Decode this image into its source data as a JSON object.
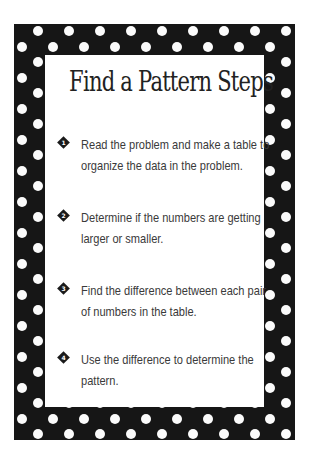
{
  "page": {
    "title": "Find a Pattern Steps",
    "steps": [
      {
        "number": "1",
        "icon": "diamond-number-icon",
        "text": "Read the problem and make a table to organize the data in the problem."
      },
      {
        "number": "2",
        "icon": "diamond-number-icon",
        "text": "Determine if the numbers are getting larger or smaller."
      },
      {
        "number": "3",
        "icon": "diamond-number-icon",
        "text": "Find the difference between each pair of numbers in the table."
      },
      {
        "number": "4",
        "icon": "diamond-number-icon",
        "text": "Use the difference to determine the pattern."
      }
    ]
  },
  "style": {
    "frame_color": "#161616",
    "dot_color": "#fbfbfb",
    "panel_color": "#ffffff",
    "text_color": "#3a3a3a"
  }
}
